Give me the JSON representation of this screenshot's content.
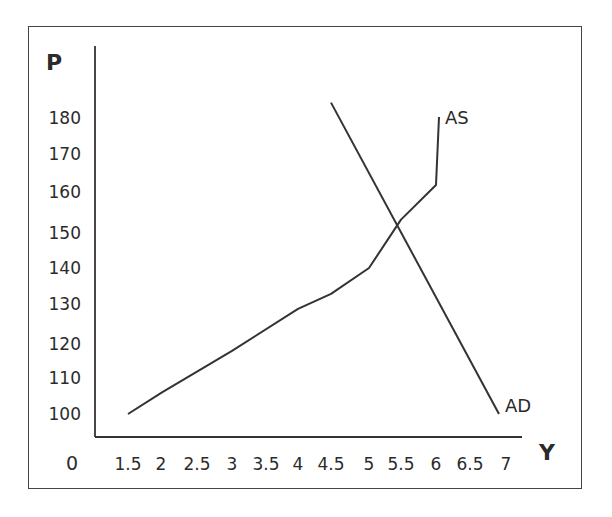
{
  "chart_data": {
    "type": "line",
    "title": "",
    "xlabel": "Y",
    "ylabel": "P",
    "origin_label": "0",
    "x_ticks": [
      "1.5",
      "2",
      "2.5",
      "3",
      "3.5",
      "4",
      "4.5",
      "5",
      "5.5",
      "6",
      "6.5",
      "7"
    ],
    "y_ticks": [
      "100",
      "110",
      "120",
      "130",
      "140",
      "150",
      "160",
      "170",
      "180"
    ],
    "xlim": [
      1.0,
      7.5
    ],
    "ylim": [
      90,
      190
    ],
    "grid": false,
    "legend": "none (curves labeled directly)",
    "series": [
      {
        "name": "AS",
        "label": "AS",
        "points": [
          [
            1.5,
            100
          ],
          [
            2,
            106
          ],
          [
            3,
            118
          ],
          [
            4,
            129
          ],
          [
            4.5,
            133
          ],
          [
            5,
            140
          ],
          [
            5.5,
            153
          ],
          [
            6,
            162
          ],
          [
            6,
            180
          ]
        ]
      },
      {
        "name": "AD",
        "label": "AD",
        "points": [
          [
            4.5,
            184
          ],
          [
            6.9,
            100
          ]
        ]
      }
    ],
    "annotations": [
      "Equilibrium intersection at approximately Y=5.5, P=150"
    ]
  },
  "labels": {
    "y_axis_title": "P",
    "x_axis_title": "Y",
    "origin": "0",
    "as_label": "AS",
    "ad_label": "AD"
  }
}
